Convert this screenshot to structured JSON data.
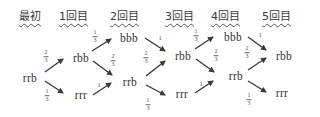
{
  "headers": [
    {
      "label": "最初",
      "x": 19
    },
    {
      "label": "1回目",
      "x": 59
    },
    {
      "label": "2回目",
      "x": 110
    },
    {
      "label": "3回目",
      "x": 165
    },
    {
      "label": "4回目",
      "x": 211
    },
    {
      "label": "5回目",
      "x": 262
    }
  ],
  "nodes": [
    {
      "id": "s0_rrb",
      "label": "rrb",
      "x": 30,
      "y": 78
    },
    {
      "id": "s1_rbb",
      "label": "rbb",
      "x": 81,
      "y": 58
    },
    {
      "id": "s1_rrr",
      "label": "rrr",
      "x": 81,
      "y": 95
    },
    {
      "id": "s2_bbb",
      "label": "bbb",
      "x": 129,
      "y": 38
    },
    {
      "id": "s2_rrb",
      "label": "rrb",
      "x": 130,
      "y": 82
    },
    {
      "id": "s3_rbb",
      "label": "rbb",
      "x": 183,
      "y": 56
    },
    {
      "id": "s3_rrr",
      "label": "rrr",
      "x": 182,
      "y": 94
    },
    {
      "id": "s4_bbb",
      "label": "bbb",
      "x": 233,
      "y": 37
    },
    {
      "id": "s4_rrb",
      "label": "rrb",
      "x": 236,
      "y": 76
    },
    {
      "id": "s5_rbb",
      "label": "rbb",
      "x": 284,
      "y": 56
    },
    {
      "id": "s5_rrr",
      "label": "rrr",
      "x": 282,
      "y": 93
    }
  ],
  "edges": [
    {
      "from": "s0_rrb",
      "to": "s1_rbb",
      "prob": "2/3",
      "x1": 45,
      "y1": 72,
      "x2": 63,
      "y2": 59,
      "lx": 46,
      "ly": 56
    },
    {
      "from": "s0_rrb",
      "to": "s1_rrr",
      "prob": "1/3",
      "x1": 45,
      "y1": 81,
      "x2": 63,
      "y2": 93,
      "lx": 47,
      "ly": 95
    },
    {
      "from": "s1_rbb",
      "to": "s2_bbb",
      "prob": "1/3",
      "x1": 92,
      "y1": 51,
      "x2": 111,
      "y2": 39,
      "lx": 95,
      "ly": 36
    },
    {
      "from": "s1_rbb",
      "to": "s2_rrb",
      "prob": "2/3",
      "x1": 93,
      "y1": 61,
      "x2": 112,
      "y2": 75,
      "lx": 113,
      "ly": 60
    },
    {
      "from": "s1_rrr",
      "to": "s2_rrb",
      "prob": "1",
      "x1": 93,
      "y1": 95,
      "x2": 111,
      "y2": 83,
      "lx": 99,
      "ly": 84
    },
    {
      "from": "s2_bbb",
      "to": "s3_rbb",
      "prob": "1",
      "x1": 145,
      "y1": 38,
      "x2": 165,
      "y2": 51,
      "lx": 160,
      "ly": 37
    },
    {
      "from": "s2_rrb",
      "to": "s3_rbb",
      "prob": "2/3",
      "x1": 146,
      "y1": 76,
      "x2": 165,
      "y2": 61,
      "lx": 146,
      "ly": 57
    },
    {
      "from": "s2_rrb",
      "to": "s3_rrr",
      "prob": "1/3",
      "x1": 146,
      "y1": 85,
      "x2": 165,
      "y2": 95,
      "lx": 148,
      "ly": 104
    },
    {
      "from": "s3_rbb",
      "to": "s4_bbb",
      "prob": "1/3",
      "x1": 195,
      "y1": 49,
      "x2": 213,
      "y2": 37,
      "lx": 196,
      "ly": 35
    },
    {
      "from": "s3_rbb",
      "to": "s4_rrb",
      "prob": "2/3",
      "x1": 196,
      "y1": 59,
      "x2": 214,
      "y2": 72,
      "lx": 216,
      "ly": 55
    },
    {
      "from": "s3_rrr",
      "to": "s4_rrb",
      "prob": "1",
      "x1": 195,
      "y1": 93,
      "x2": 213,
      "y2": 81,
      "lx": 201,
      "ly": 83
    },
    {
      "from": "s4_bbb",
      "to": "s5_rbb",
      "prob": "1",
      "x1": 248,
      "y1": 37,
      "x2": 266,
      "y2": 50,
      "lx": 260,
      "ly": 34
    },
    {
      "from": "s4_rrb",
      "to": "s5_rbb",
      "prob": "2/3",
      "x1": 248,
      "y1": 70,
      "x2": 266,
      "y2": 58,
      "lx": 247,
      "ly": 52
    },
    {
      "from": "s4_rrb",
      "to": "s5_rrr",
      "prob": "1/3",
      "x1": 248,
      "y1": 81,
      "x2": 266,
      "y2": 92,
      "lx": 249,
      "ly": 99
    }
  ],
  "colors": {
    "text": "#333333",
    "arrow": "#3a3a3a",
    "fraction": "#555555"
  }
}
